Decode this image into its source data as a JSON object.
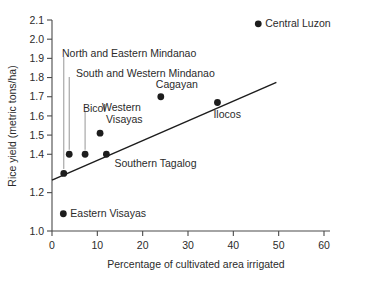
{
  "chart_data": {
    "type": "scatter",
    "title": "",
    "xlabel": "Percentage of cultivated area irrigated",
    "ylabel": "Rice yield (metric tons/ha)",
    "xlim": [
      0,
      60
    ],
    "ylim": [
      1.0,
      2.1
    ],
    "grid": false,
    "legend": "none",
    "xticks": [
      "0",
      "10",
      "20",
      "30",
      "40",
      "50",
      "60"
    ],
    "xtick_values": [
      0,
      10,
      20,
      30,
      40,
      50,
      60
    ],
    "yticks": [
      "1.0",
      "1.2",
      "1.4",
      "1.5",
      "1.6",
      "1.7",
      "1.8",
      "1.9",
      "2.0",
      "2.1"
    ],
    "ytick_values": [
      1.0,
      1.2,
      1.4,
      1.5,
      1.6,
      1.7,
      1.8,
      1.9,
      2.0,
      2.1
    ],
    "points": [
      {
        "label": "Eastern Visayas",
        "x": 2.5,
        "y": 1.09
      },
      {
        "label": "North and Eastern Mindanao",
        "x": 2.6,
        "y": 1.3
      },
      {
        "label": "South and Western Mindanao",
        "x": 3.8,
        "y": 1.4
      },
      {
        "label": "Bicol",
        "x": 7.3,
        "y": 1.4
      },
      {
        "label": "Western Visayas",
        "x": 10.6,
        "y": 1.51
      },
      {
        "label": "Southern Tagalog",
        "x": 12.0,
        "y": 1.4
      },
      {
        "label": "Cagayan",
        "x": 24.0,
        "y": 1.7
      },
      {
        "label": "Ilocos",
        "x": 36.5,
        "y": 1.67
      },
      {
        "label": "Central Luzon",
        "x": 45.5,
        "y": 2.08
      }
    ],
    "trend_line": {
      "x0": 0,
      "y0": 1.265,
      "x1": 49.5,
      "y1": 1.775
    },
    "annotations": [
      {
        "text": "Central Luzon",
        "for": "Central Luzon",
        "placement": "right-of-point"
      },
      {
        "text": "North and Eastern Mindanao",
        "for": "North and Eastern Mindanao",
        "placement": "leader-line-up"
      },
      {
        "text": "South and Western Mindanao",
        "for": "South and Western Mindanao",
        "placement": "leader-line-up"
      },
      {
        "text": "Bicol",
        "for": "Bicol",
        "placement": "leader-line-up"
      },
      {
        "text": "Cagayan",
        "for": "Cagayan",
        "placement": "above-point"
      },
      {
        "text": "Ilocos",
        "for": "Ilocos",
        "placement": "below-right-of-point"
      },
      {
        "text": "Western Visayas",
        "for": "Western Visayas",
        "placement": "above-point-two-line"
      },
      {
        "text": "Western",
        "line": 1
      },
      {
        "text": "Visayas",
        "line": 2
      },
      {
        "text": "Southern Tagalog",
        "for": "Southern Tagalog",
        "placement": "right-of-point"
      },
      {
        "text": "Eastern Visayas",
        "for": "Eastern Visayas",
        "placement": "right-of-point"
      }
    ],
    "colors": {
      "point": "#1d1d1d",
      "trend": "#1d1d1d",
      "axis": "#4a4a4a",
      "leader": "#8a8a8a",
      "text": "#2b2b2b",
      "background": "#ffffff"
    }
  }
}
